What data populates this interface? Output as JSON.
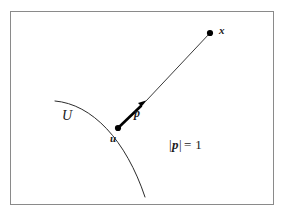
{
  "figure": {
    "kind": "geometry-diagram",
    "background_color": "#ffffff",
    "frame": {
      "stroke_color": "#8a8a8a",
      "stroke_width": 1,
      "x": 10.5,
      "y": 11.5,
      "width": 263,
      "height": 193
    },
    "labels": {
      "set_label": "U",
      "base_point_label": "u",
      "direction_label": "p",
      "target_point_label": "x",
      "norm_bar": "|",
      "norm_vector": "p",
      "norm_equals": "=",
      "norm_value": "1",
      "norm_full": "|p| = 1"
    },
    "geometry": {
      "arc": {
        "description": "boundary-of-U",
        "start": [
          55,
          101
        ],
        "control1": [
          92,
          104
        ],
        "control2": [
          126,
          140
        ],
        "end": [
          145,
          197
        ],
        "stroke_color": "#2b2b2b",
        "stroke_width": 1
      },
      "base_point": {
        "x": 118,
        "y": 128,
        "radius": 3.1,
        "fill": "#000000"
      },
      "target_point": {
        "x": 210,
        "y": 33,
        "radius": 3.1,
        "fill": "#000000"
      },
      "arrow": {
        "from": [
          118,
          128
        ],
        "to": [
          146.5,
          100.5
        ],
        "stroke_color": "#000000",
        "stroke_width": 2.6,
        "head_length": 10,
        "head_half_width": 3.8
      },
      "ray": {
        "from": [
          146.5,
          100.5
        ],
        "to": [
          210,
          33
        ],
        "stroke_color": "#3a3a3a",
        "stroke_width": 1
      }
    }
  }
}
